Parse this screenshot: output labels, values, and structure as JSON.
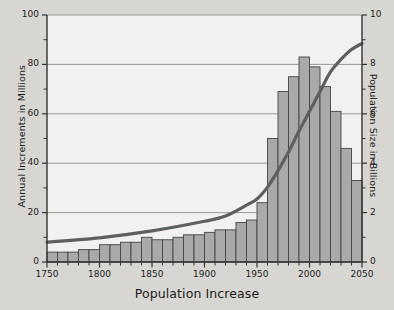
{
  "chart_data": {
    "type": "bar",
    "title": "",
    "xlabel": "Population Increase",
    "ylabel": "Annual Increments in Millions",
    "ylabel_right": "Population Size in Billions",
    "xlim": [
      1750,
      2050
    ],
    "ylim": [
      0,
      100
    ],
    "ylim_right": [
      0,
      10
    ],
    "xticks": [
      1750,
      1800,
      1850,
      1900,
      1950,
      2000,
      2050
    ],
    "xticks_minor_step": 10,
    "yticks": [
      0,
      20,
      40,
      60,
      80,
      100
    ],
    "yticks_minor": [
      10,
      30,
      50,
      70,
      90
    ],
    "yticks_right": [
      0,
      2,
      4,
      6,
      8,
      10
    ],
    "yticks_right_minor": [
      1,
      3,
      5,
      7,
      9
    ],
    "grid": true,
    "grid_axis": "y",
    "legend": false,
    "colors": {
      "background": "#d8d6d2",
      "plot_background": "#f2f1ef",
      "bar_fill": "#a9a9a7",
      "bar_edge": "#444444",
      "line": "#5f5f5f",
      "grid": "#9a9a98",
      "axis": "#333333",
      "text": "#1a1a1a"
    },
    "categories": [
      1750,
      1760,
      1770,
      1780,
      1790,
      1800,
      1810,
      1820,
      1830,
      1840,
      1850,
      1860,
      1870,
      1880,
      1890,
      1900,
      1910,
      1920,
      1930,
      1940,
      1950,
      1960,
      1970,
      1980,
      1990,
      2000,
      2010,
      2020,
      2030,
      2040
    ],
    "series": [
      {
        "name": "Annual Increments in Millions",
        "plot": "bar",
        "axis": "left",
        "values": [
          4,
          4,
          4,
          5,
          5,
          7,
          7,
          8,
          8,
          10,
          9,
          9,
          10,
          11,
          11,
          12,
          13,
          13,
          16,
          17,
          24,
          50,
          69,
          75,
          83,
          79,
          71,
          61,
          46,
          33
        ]
      },
      {
        "name": "Population Size in Billions",
        "plot": "line",
        "axis": "right",
        "x": [
          1750,
          1800,
          1850,
          1900,
          1920,
          1940,
          1950,
          1960,
          1970,
          1980,
          1990,
          2000,
          2010,
          2020,
          2030,
          2040,
          2050
        ],
        "values": [
          0.8,
          0.98,
          1.26,
          1.65,
          1.86,
          2.3,
          2.55,
          3.03,
          3.7,
          4.45,
          5.3,
          6.1,
          6.9,
          7.7,
          8.2,
          8.6,
          8.85
        ]
      }
    ]
  },
  "axes": {
    "left_title": "Annual Increments in Millions",
    "right_title": "Population Size in Billions",
    "bottom_title": "Population Increase",
    "left_ticks": [
      "100",
      "80",
      "60",
      "40",
      "20",
      "0"
    ],
    "right_ticks": [
      "10",
      "8",
      "6",
      "4",
      "2",
      "0"
    ],
    "bottom_ticks": [
      "1750",
      "1800",
      "1850",
      "1900",
      "1950",
      "2000",
      "2050"
    ]
  }
}
